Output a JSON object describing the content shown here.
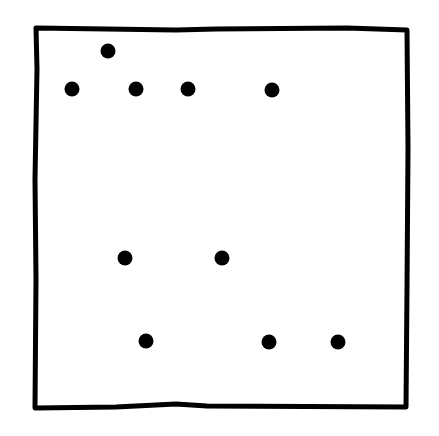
{
  "diagram": {
    "type": "dot-grid-sketch",
    "background": "#ffffff",
    "stroke_color": "#000000",
    "box": {
      "x1": 36,
      "y1": 29,
      "x2": 407,
      "y2": 407,
      "stroke_width": 5
    },
    "dot_radius": 7.5,
    "dots": [
      {
        "x": 108,
        "y": 51
      },
      {
        "x": 72,
        "y": 89
      },
      {
        "x": 136,
        "y": 89
      },
      {
        "x": 188,
        "y": 89
      },
      {
        "x": 272,
        "y": 90
      },
      {
        "x": 125,
        "y": 258
      },
      {
        "x": 222,
        "y": 258
      },
      {
        "x": 146,
        "y": 341
      },
      {
        "x": 269,
        "y": 342
      },
      {
        "x": 338,
        "y": 342
      }
    ],
    "dot_count": 10
  }
}
